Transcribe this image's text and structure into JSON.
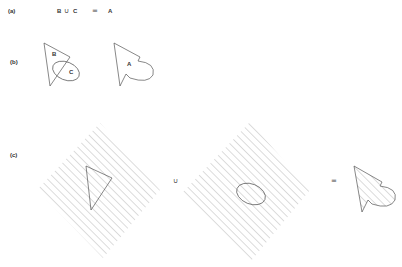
{
  "panels": {
    "a": {
      "label": "(a)",
      "expression": {
        "left": "B",
        "op": "∪",
        "right": "C",
        "equals": "=",
        "result": "A"
      }
    },
    "b": {
      "label": "(b)",
      "region_labels": {
        "b": "B",
        "c": "C",
        "a": "A"
      }
    },
    "c": {
      "label": "(c)",
      "union_symbol": "∪",
      "equals_symbol": "="
    }
  },
  "colors": {
    "stroke": "#555555",
    "hatch": "#8a8a8a",
    "background": "#ffffff"
  }
}
